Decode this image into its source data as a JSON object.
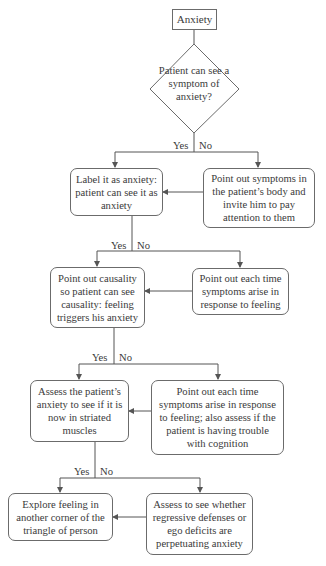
{
  "flowchart": {
    "start": "Anxiety",
    "decision": "Patient can see a symptom of anxiety?",
    "branch_labels": {
      "yes": "Yes",
      "no": "No"
    },
    "levels": [
      {
        "yes": "Label it as anxiety: patient can see it as anxiety",
        "no": "Point out symptoms in the patient’s body and invite him to pay attention to them"
      },
      {
        "yes": "Point out causality so patient can see causality: feeling triggers his anxiety",
        "no": "Point out each time symptoms arise in response to feeling"
      },
      {
        "yes": "Assess the patient’s anxiety to see if it is now in striated muscles",
        "no": "Point out each time symptoms arise in response to feeling; also assess if the patient is having trouble with cognition"
      },
      {
        "yes": "Explore feeling in another corner of the triangle of person",
        "no": "Assess to see whether regressive defenses or ego deficits are perpetuating anxiety"
      }
    ]
  },
  "colors": {
    "line": "#555555",
    "text": "#3a3a3a",
    "background": "#ffffff"
  }
}
